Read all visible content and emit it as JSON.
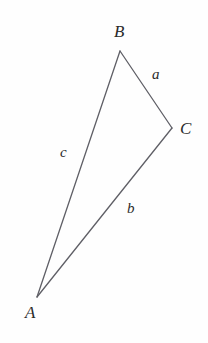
{
  "figure": {
    "kind": "geometry-diagram",
    "shape": "triangle",
    "background_color": "#fefefe",
    "stroke_color": "#5f5f66",
    "stroke_width": 1.3,
    "text_color": "#2b2b2b",
    "width": 208,
    "height": 343
  },
  "vertices": [
    {
      "id": "A",
      "label": "A",
      "x": 37,
      "y": 297
    },
    {
      "id": "B",
      "label": "B",
      "x": 120,
      "y": 51
    },
    {
      "id": "C",
      "label": "C",
      "x": 172,
      "y": 128
    }
  ],
  "sides": [
    {
      "id": "a",
      "label": "a",
      "from": "B",
      "to": "C",
      "opposite_vertex": "A"
    },
    {
      "id": "b",
      "label": "b",
      "from": "A",
      "to": "C",
      "opposite_vertex": "B"
    },
    {
      "id": "c",
      "label": "c",
      "from": "A",
      "to": "B",
      "opposite_vertex": "C"
    }
  ],
  "labels": {
    "vertex_A": "A",
    "vertex_B": "B",
    "vertex_C": "C",
    "side_a": "a",
    "side_b": "b",
    "side_c": "c"
  }
}
